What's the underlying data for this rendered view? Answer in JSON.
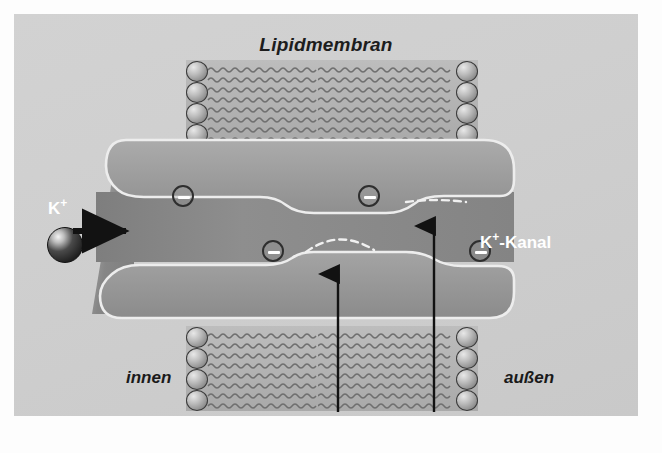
{
  "figure": {
    "title": "Lipidmembran",
    "background_color": "#cfcfcf",
    "frame_color": "#fdfdfd"
  },
  "labels": {
    "membrane_title": "Lipidmembran",
    "ion_label": "K",
    "ion_charge": "+",
    "channel_label_main": "-Kanal",
    "channel_label_ion": "K",
    "channel_label_charge": "+",
    "inside": "innen",
    "outside": "außen"
  },
  "diagram": {
    "type": "biology-schematic",
    "protein_color": "#9a9a9a",
    "protein_outline_color": "#efefef",
    "lipid_tail_color": "#6f6f6f",
    "lipid_head_color": "#a8a8a8",
    "ion_color": "#1e1e1e",
    "charge_symbol": "−",
    "charge_count": 4,
    "charges": [
      {
        "id": "charge-upper-left",
        "x": 170,
        "y": 196,
        "wall": "upper-pore-wall"
      },
      {
        "id": "charge-upper-right",
        "x": 356,
        "y": 196,
        "wall": "upper-pore-wall"
      },
      {
        "id": "charge-lower-left",
        "x": 260,
        "y": 251,
        "wall": "lower-pore-wall"
      },
      {
        "id": "charge-lower-right",
        "x": 467,
        "y": 251,
        "wall": "lower-pore-wall"
      }
    ],
    "bilayer_blocks": [
      {
        "id": "bilayer-top-left",
        "x": 186,
        "y": 60,
        "w": 132,
        "h": 85,
        "heads": "left"
      },
      {
        "id": "bilayer-top-right",
        "x": 318,
        "y": 60,
        "w": 160,
        "h": 85,
        "heads": "right"
      },
      {
        "id": "bilayer-bottom-left",
        "x": 186,
        "y": 326,
        "w": 132,
        "h": 85,
        "heads": "left"
      },
      {
        "id": "bilayer-bottom-right",
        "x": 318,
        "y": 326,
        "w": 160,
        "h": 85,
        "heads": "right"
      }
    ],
    "arrows": [
      {
        "id": "ion-entry-arrow",
        "direction": "right",
        "x1": 73,
        "y1": 231,
        "x2": 131,
        "y2": 231,
        "color": "#121212"
      },
      {
        "id": "gate-arrow-left",
        "direction": "up",
        "x1": 338,
        "y1": 410,
        "x2": 338,
        "y2": 266,
        "color": "#121212"
      },
      {
        "id": "gate-arrow-right",
        "direction": "up",
        "x1": 434,
        "y1": 410,
        "x2": 434,
        "y2": 224,
        "color": "#121212"
      }
    ],
    "dashed_arcs": [
      {
        "id": "arc-lower-pore",
        "x": 300,
        "y": 246,
        "w": 74,
        "h": 18,
        "color": "#f2f2f2"
      },
      {
        "id": "arc-upper-pore",
        "x": 400,
        "y": 202,
        "w": 74,
        "h": 14,
        "color": "#f2f2f2"
      }
    ]
  }
}
